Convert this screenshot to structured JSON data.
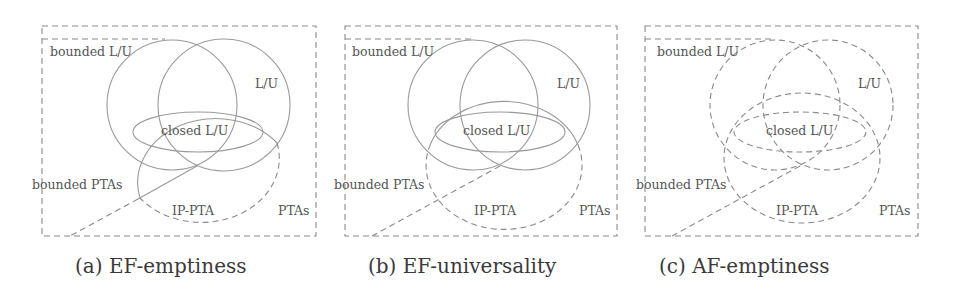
{
  "figure": {
    "panels": [
      {
        "id": "a",
        "caption": "(a) EF-emptiness",
        "labels": {
          "bounded_lu": "bounded L/U",
          "lu": "L/U",
          "closed_lu": "closed L/U",
          "bounded_ptas": "bounded PTAs",
          "ip_pta": "IP-PTA",
          "ptas": "PTAs"
        },
        "decidable_regions": [
          "bounded L/U",
          "L/U",
          "closed L/U",
          "bounded PTAs (part of IP-PTA)"
        ],
        "style_note": "circles solid; IP-PTA solid inside L/U union and bounded PTAs, dashed elsewhere"
      },
      {
        "id": "b",
        "caption": "(b) EF-universality",
        "labels": {
          "bounded_lu": "bounded L/U",
          "lu": "L/U",
          "closed_lu": "closed L/U",
          "bounded_ptas": "bounded PTAs",
          "ip_pta": "IP-PTA",
          "ptas": "PTAs"
        },
        "decidable_regions": [
          "bounded L/U",
          "L/U",
          "closed L/U"
        ],
        "style_note": "circles solid; IP-PTA solid only inside L/U union, dashed elsewhere"
      },
      {
        "id": "c",
        "caption": "(c) AF-emptiness",
        "labels": {
          "bounded_lu": "bounded L/U",
          "lu": "L/U",
          "closed_lu": "closed L/U",
          "bounded_ptas": "bounded PTAs",
          "ip_pta": "IP-PTA",
          "ptas": "PTAs"
        },
        "decidable_regions": [],
        "style_note": "all boundaries dashed"
      }
    ],
    "colors": {
      "stroke_solid": "#9a9a9a",
      "stroke_dashed": "#8a8a8a",
      "label_text": "#555555",
      "caption_text": "#3a3a3a"
    }
  }
}
